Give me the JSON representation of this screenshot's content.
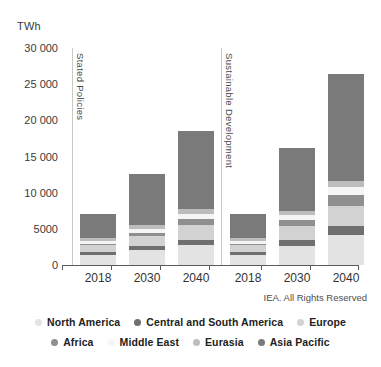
{
  "chart_data": {
    "type": "bar",
    "subtype": "stacked-bar",
    "title": "",
    "ylabel": "TWh",
    "xlabel": "",
    "ylim": [
      0,
      30000
    ],
    "ytick_step": 5000,
    "ytick_labels": [
      "30 000",
      "25 000",
      "20 000",
      "15 000",
      "10 000",
      "5000",
      "0"
    ],
    "ytick_values": [
      30000,
      25000,
      20000,
      15000,
      10000,
      5000,
      0
    ],
    "grid": false,
    "legend_position": "bottom",
    "categories": [
      "2018",
      "2030",
      "2040",
      "2018",
      "2030",
      "2040"
    ],
    "panels": [
      {
        "label": "Stated Policies",
        "categories": [
          "2018",
          "2030",
          "2040"
        ]
      },
      {
        "label": "Sustainable Development",
        "categories": [
          "2018",
          "2030",
          "2040"
        ]
      }
    ],
    "series": [
      {
        "name": "North America",
        "color": "#e3e3e3",
        "values": [
          1430,
          2080,
          2700,
          1430,
          2690,
          4110
        ]
      },
      {
        "name": "Central and South America",
        "color": "#6f6f6f",
        "values": [
          330,
          520,
          810,
          330,
          790,
          1320
        ]
      },
      {
        "name": "Europe",
        "color": "#d2d2d2",
        "values": [
          1000,
          1450,
          1980,
          1000,
          1950,
          2770
        ]
      },
      {
        "name": "Africa",
        "color": "#8f8f8f",
        "values": [
          210,
          430,
          880,
          210,
          860,
          1490
        ]
      },
      {
        "name": "Middle East",
        "color": "#f5f5f5",
        "values": [
          290,
          470,
          720,
          290,
          560,
          1130
        ]
      },
      {
        "name": "Eurasia",
        "color": "#bdbdbd",
        "values": [
          430,
          560,
          700,
          430,
          610,
          820
        ]
      },
      {
        "name": "Asia Pacific",
        "color": "#7a7a7a",
        "values": [
          3350,
          7050,
          10680,
          3400,
          8660,
          14740
        ]
      }
    ],
    "totals": [
      7040,
      12560,
      18470,
      7090,
      16120,
      26380
    ],
    "annotations": {
      "credit": "IEA. All Rights Reserved"
    }
  },
  "axis": {
    "unit_label": "TWh"
  },
  "legend": {
    "rows": [
      [
        {
          "label": "North America",
          "color": "#e3e3e3"
        },
        {
          "label": "Central and South America",
          "color": "#6f6f6f"
        },
        {
          "label": "Europe",
          "color": "#d2d2d2"
        }
      ],
      [
        {
          "label": "Africa",
          "color": "#8f8f8f"
        },
        {
          "label": "Middle East",
          "color": "#f5f5f5"
        },
        {
          "label": "Eurasia",
          "color": "#bdbdbd"
        },
        {
          "label": "Asia Pacific",
          "color": "#7a7a7a"
        }
      ]
    ]
  },
  "footer": {
    "credit": "IEA. All Rights Reserved"
  }
}
